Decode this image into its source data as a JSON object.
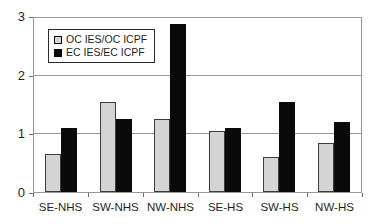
{
  "chart_data": {
    "type": "bar",
    "title": "",
    "xlabel": "",
    "ylabel": "",
    "categories": [
      "SE-NHS",
      "SW-NHS",
      "NW-NHS",
      "SE-HS",
      "SW-HS",
      "NW-HS"
    ],
    "series": [
      {
        "name": "OC IES/OC ICPF",
        "color": "#d4d4d4",
        "values": [
          0.65,
          1.55,
          1.25,
          1.05,
          0.6,
          0.85
        ]
      },
      {
        "name": "EC IES/EC ICPF",
        "color": "#0a0a0a",
        "values": [
          1.1,
          1.25,
          2.9,
          1.1,
          1.55,
          1.2
        ]
      }
    ],
    "ylim": [
      0,
      3
    ],
    "yticks": [
      0,
      1,
      2,
      3
    ],
    "ytick_labels": [
      "0",
      "1",
      "2",
      "3"
    ],
    "grid": true,
    "legend_position": "top-left"
  },
  "colors": {
    "background": "#ffffff",
    "plot_border": "#969696",
    "gridline": "#969696",
    "bar_border": "#3c3c3c",
    "text": "#1f1f1f"
  }
}
